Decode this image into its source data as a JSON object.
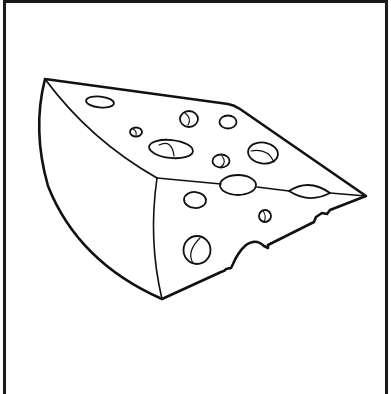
{
  "image": {
    "subject": "Cheese wedge coloring page",
    "style": "black line art on white",
    "colors": {
      "line": "#111111",
      "background": "#ffffff",
      "border": "#1a1a1a"
    }
  },
  "illustration": {
    "title": "Swiss cheese wedge",
    "holes_top_face": 8,
    "holes_front_face": 4,
    "holes_on_edge": 2,
    "bite_notches": 1
  }
}
